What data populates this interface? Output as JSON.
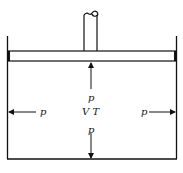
{
  "diagram": {
    "labels": {
      "pressure_top": "p",
      "state": "V T",
      "pressure_bottom": "p",
      "pressure_left": "p",
      "pressure_right": "p"
    },
    "colors": {
      "stroke": "#111111",
      "background": "#ffffff"
    }
  }
}
